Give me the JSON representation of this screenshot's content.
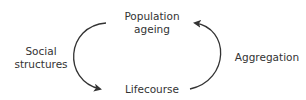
{
  "diagram": {
    "nodes": {
      "top": {
        "line1": "Population",
        "line2": "ageing"
      },
      "bottom": {
        "label": "Lifecourse"
      }
    },
    "edges": {
      "left": {
        "line1": "Social",
        "line2": "structures",
        "direction": "Population ageing → Lifecourse"
      },
      "right": {
        "label": "Aggregation",
        "direction": "Lifecourse → Population ageing"
      }
    },
    "colors": {
      "line": "#333333",
      "text": "#333333"
    }
  }
}
